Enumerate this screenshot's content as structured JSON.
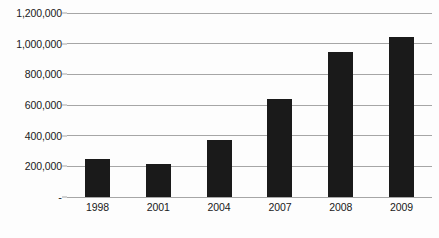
{
  "chart_data": {
    "type": "bar",
    "title": "",
    "subtitle": "",
    "xlabel": "",
    "ylabel": "",
    "categories": [
      "1998",
      "2001",
      "2004",
      "2007",
      "2008",
      "2009"
    ],
    "values": [
      250000,
      218000,
      372000,
      640000,
      945000,
      1043000
    ],
    "series": [
      {
        "name": "",
        "values": [
          250000,
          218000,
          372000,
          640000,
          945000,
          1043000
        ]
      }
    ],
    "ylim": [
      0,
      1200000
    ],
    "ytick_values": [
      0,
      200000,
      400000,
      600000,
      800000,
      1000000,
      1200000
    ],
    "ytick_labels": [
      "-",
      "200,000",
      "400,000",
      "600,000",
      "800,000",
      "1,000,000",
      "1,200,000"
    ],
    "grid": true,
    "grid_axis": "y",
    "legend": false,
    "legend_position": "none",
    "annotations": [],
    "colors": {
      "bar": "#1a1a1a",
      "gridline": "#a6a6a6",
      "background": "#fdfdfd",
      "text": "#1a1a1a"
    }
  }
}
